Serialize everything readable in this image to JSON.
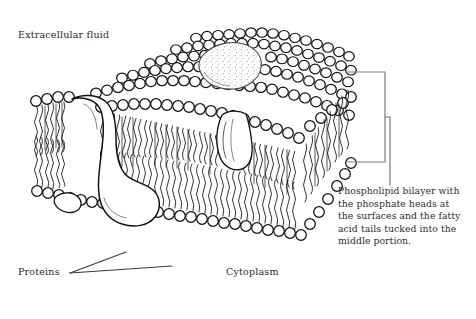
{
  "figure": {
    "background_color": "#ffffff",
    "ink_color": "#1a1a1a",
    "text_color": "#2b2b2b"
  },
  "labels": {
    "extracellular": "Extracellular fluid",
    "proteins": "Proteins",
    "cytoplasm": "Cytoplasm"
  },
  "caption": {
    "lines": [
      "Phospholipid bilayer with",
      "the phosphate heads at",
      "the surfaces and the fatty",
      "acid tails tucked into the",
      "middle portion."
    ]
  },
  "structures": {
    "phosphate_head": "circle",
    "fatty_acid_tail": "wavy-line",
    "glycoprotein_blob": "stippled-blob",
    "transmembrane_protein": "channel-protein",
    "peripheral_protein": "lobed-protein"
  },
  "annotations": {
    "bracket": "curly-brace-right",
    "proteins_leader": "v-shaped-leader-lines"
  }
}
